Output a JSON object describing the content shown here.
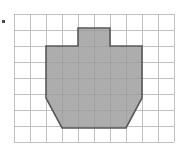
{
  "figure": {
    "title": "",
    "type": "grid-polygon-diagram",
    "bullet": {
      "name": "bullet-marker",
      "x": 2,
      "y": 20,
      "size": 3,
      "color": "#4a4a4a"
    },
    "grid": {
      "origin_x": 14,
      "origin_y": 14,
      "cell_size": 16,
      "columns": 10,
      "rows": 8,
      "line_color": "#dcdcdc",
      "border_color": "#d0d0d0",
      "background": "#ffffff"
    },
    "polygon": {
      "name": "shaded-polygon",
      "fill_color": "#a9a9a9",
      "fill_opacity": 0.95,
      "stroke_color": "#595959",
      "stroke_width": 1.6,
      "description": "Pail / bucket shaped polygon with a small rectangular tab on top and angled lower corners",
      "vertices_px": [
        [
          78,
          28
        ],
        [
          110,
          28
        ],
        [
          110,
          46
        ],
        [
          142,
          46
        ],
        [
          142,
          98
        ],
        [
          126,
          128
        ],
        [
          62,
          128
        ],
        [
          46,
          98
        ],
        [
          46,
          46
        ],
        [
          78,
          46
        ]
      ],
      "vertices_grid": [
        [
          4,
          0.875
        ],
        [
          6,
          0.875
        ],
        [
          6,
          2
        ],
        [
          8,
          2
        ],
        [
          8,
          5.25
        ],
        [
          7,
          7.125
        ],
        [
          3,
          7.125
        ],
        [
          2,
          5.25
        ],
        [
          2,
          2
        ],
        [
          4,
          2
        ]
      ]
    }
  }
}
